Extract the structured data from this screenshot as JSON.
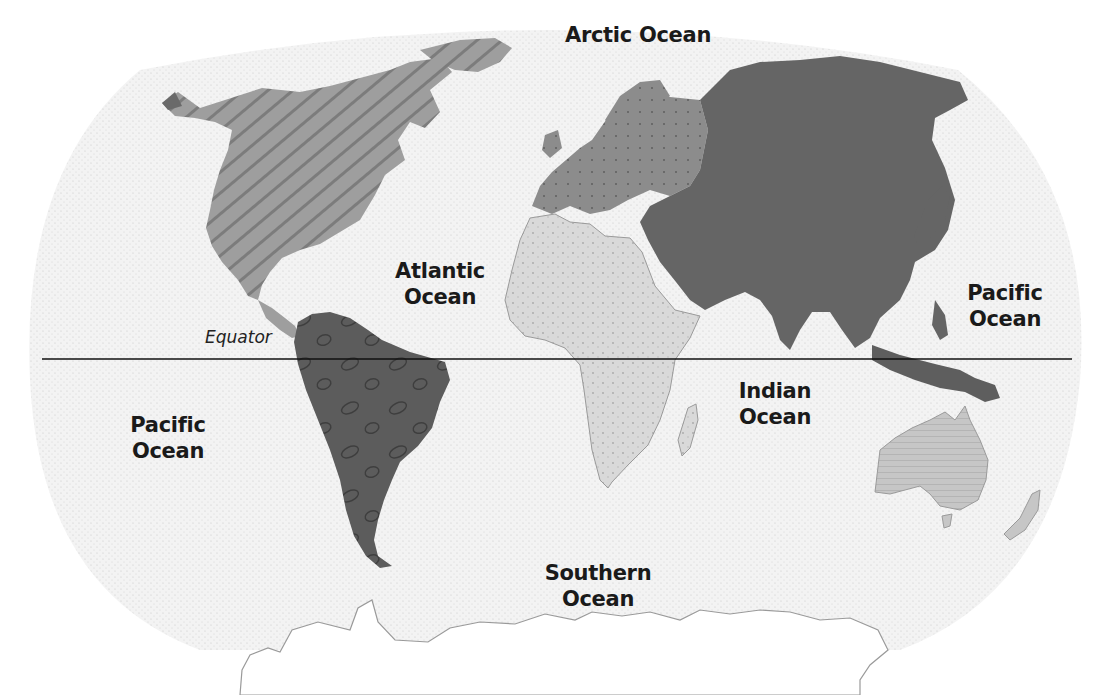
{
  "map": {
    "title": "World Oceans and Continents",
    "colors": {
      "ocean_background": "#f1f1f1",
      "north_america": "#9a9a9a",
      "south_america": "#5a5a5a",
      "europe": "#8a8a8a",
      "asia": "#6a6a6a",
      "africa": "#d8d8d8",
      "australia": "#c4c4c4",
      "antarctica": "#ffffff",
      "equator_line": "#111111"
    },
    "ocean_labels": {
      "arctic": "Arctic Ocean",
      "atlantic_line1": "Atlantic",
      "atlantic_line2": "Ocean",
      "pacific_east_line1": "Pacific",
      "pacific_east_line2": "Ocean",
      "pacific_west_line1": "Pacific",
      "pacific_west_line2": "Ocean",
      "indian_line1": "Indian",
      "indian_line2": "Ocean",
      "southern_line1": "Southern",
      "southern_line2": "Ocean"
    },
    "equator_label": "Equator"
  }
}
